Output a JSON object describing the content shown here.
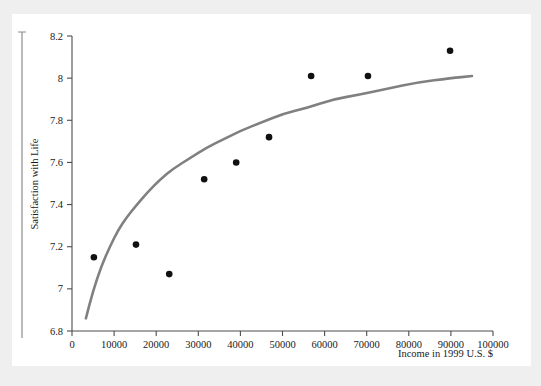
{
  "figure": {
    "background_color": "#ffffff",
    "border_tint_color": "#efefef"
  },
  "chart_data": {
    "type": "scatter",
    "title": "",
    "subtitle": "",
    "xlabel": "Income in 1999 U.S. $",
    "ylabel": "Satisfaction with Life",
    "xlim": [
      0,
      100000
    ],
    "ylim": [
      6.8,
      8.2
    ],
    "grid": false,
    "legend": null,
    "xticks": [
      0,
      10000,
      20000,
      30000,
      40000,
      50000,
      60000,
      70000,
      80000,
      90000,
      100000
    ],
    "xtick_labels": [
      "0",
      "10000",
      "20000",
      "30000",
      "40000",
      "50000",
      "60000",
      "70000",
      "80000",
      "90000",
      "100000"
    ],
    "yticks": [
      6.8,
      7,
      7.2,
      7.4,
      7.6,
      7.8,
      8,
      8.2
    ],
    "ytick_labels": [
      "6.8",
      "7",
      "7.2",
      "7.4",
      "7.6",
      "7.8",
      "8",
      "8.2"
    ],
    "series": [
      {
        "name": "Observed countries",
        "type": "scatter",
        "marker": "circle",
        "color": "#111111",
        "points": [
          {
            "x": 5200,
            "y": 7.15
          },
          {
            "x": 15200,
            "y": 7.21
          },
          {
            "x": 23100,
            "y": 7.07
          },
          {
            "x": 31400,
            "y": 7.52
          },
          {
            "x": 39000,
            "y": 7.6
          },
          {
            "x": 46800,
            "y": 7.72
          },
          {
            "x": 56800,
            "y": 8.01
          },
          {
            "x": 70300,
            "y": 8.01
          },
          {
            "x": 89800,
            "y": 8.13
          }
        ]
      },
      {
        "name": "Fitted logarithmic curve",
        "type": "line",
        "color": "#808080",
        "points": [
          {
            "x": 3300,
            "y": 6.86
          },
          {
            "x": 5000,
            "y": 6.99
          },
          {
            "x": 7000,
            "y": 7.11
          },
          {
            "x": 9000,
            "y": 7.2
          },
          {
            "x": 11000,
            "y": 7.28
          },
          {
            "x": 13000,
            "y": 7.34
          },
          {
            "x": 15000,
            "y": 7.39
          },
          {
            "x": 18000,
            "y": 7.46
          },
          {
            "x": 21000,
            "y": 7.52
          },
          {
            "x": 24000,
            "y": 7.57
          },
          {
            "x": 28000,
            "y": 7.62
          },
          {
            "x": 32000,
            "y": 7.67
          },
          {
            "x": 36000,
            "y": 7.71
          },
          {
            "x": 40000,
            "y": 7.75
          },
          {
            "x": 45000,
            "y": 7.79
          },
          {
            "x": 50000,
            "y": 7.83
          },
          {
            "x": 56000,
            "y": 7.86
          },
          {
            "x": 62000,
            "y": 7.9
          },
          {
            "x": 68000,
            "y": 7.92
          },
          {
            "x": 75000,
            "y": 7.95
          },
          {
            "x": 82000,
            "y": 7.98
          },
          {
            "x": 90000,
            "y": 8.0
          },
          {
            "x": 95000,
            "y": 8.01
          }
        ]
      }
    ]
  }
}
